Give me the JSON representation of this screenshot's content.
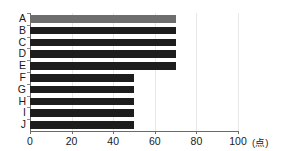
{
  "chart_data": {
    "type": "bar",
    "orientation": "horizontal",
    "title": "",
    "subtitle": "",
    "xlabel": "",
    "ylabel": "",
    "unit_label": "(点)",
    "categories": [
      "A",
      "B",
      "C",
      "D",
      "E",
      "F",
      "G",
      "H",
      "I",
      "J"
    ],
    "values": [
      70,
      70,
      70,
      70,
      70,
      50,
      50,
      50,
      50,
      50
    ],
    "series": [
      {
        "name": "",
        "values": [
          70,
          70,
          70,
          70,
          70,
          50,
          50,
          50,
          50,
          50
        ]
      }
    ],
    "xlim": [
      0,
      100
    ],
    "xticks": [
      0,
      20,
      40,
      60,
      80,
      100
    ],
    "xtick_labels": [
      "0",
      "20",
      "40",
      "60",
      "80",
      "100"
    ],
    "grid": true,
    "grid_axis": "x",
    "legend": false,
    "legend_position": "none",
    "bar_colors": [
      "#6e6e6e",
      "#1d1d1d",
      "#1d1d1d",
      "#1d1d1d",
      "#1d1d1d",
      "#1d1d1d",
      "#1d1d1d",
      "#1d1d1d",
      "#1d1d1d",
      "#1d1d1d"
    ],
    "highlighted_category": "A",
    "background_color": "#ffffff",
    "axis_color": "#6b6b6b",
    "grid_color": "#e8e8e8"
  }
}
